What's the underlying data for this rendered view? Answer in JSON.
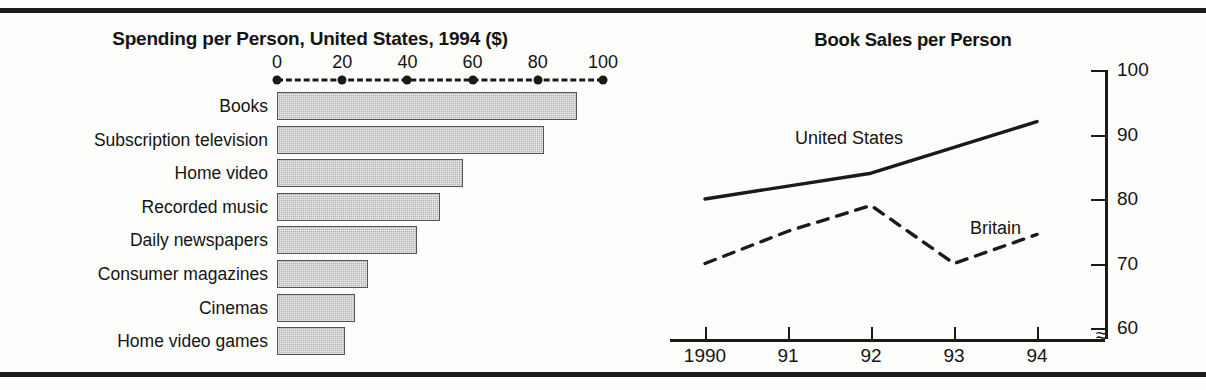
{
  "figure": {
    "panels": [
      {
        "id": "spending-per-person",
        "title": "Spending per Person, United States, 1994 ($)"
      },
      {
        "id": "book-sales-per-person",
        "title": "Book Sales per Person"
      }
    ]
  },
  "chart_data": [
    {
      "type": "bar",
      "orientation": "horizontal",
      "title": "Spending per Person, United States, 1994 ($)",
      "xlabel": "",
      "ylabel": "",
      "xlim": [
        0,
        100
      ],
      "grid": false,
      "legend": "none",
      "axis_position": "top",
      "tick_labels": [
        "0",
        "20",
        "40",
        "60",
        "80",
        "100"
      ],
      "ticks": [
        0,
        20,
        40,
        60,
        80,
        100
      ],
      "categories": [
        "Books",
        "Subscription television",
        "Home video",
        "Recorded music",
        "Daily newspapers",
        "Consumer magazines",
        "Cinemas",
        "Home video games"
      ],
      "values": [
        92,
        82,
        57,
        50,
        43,
        28,
        24,
        21
      ],
      "bar_fill": "#b6b6b6",
      "bar_border": "#555555"
    },
    {
      "type": "line",
      "title": "Book Sales per Person",
      "xlabel": "",
      "ylabel": "",
      "x": [
        1990,
        1991,
        1992,
        1993,
        1994
      ],
      "x_tick_labels": [
        "1990",
        "91",
        "92",
        "93",
        "94"
      ],
      "ylim": [
        60,
        100
      ],
      "y_ticks": [
        60,
        70,
        80,
        90,
        100
      ],
      "y_tick_labels": [
        "60",
        "70",
        "80",
        "90",
        "100"
      ],
      "y_axis_position": "right",
      "axis_break": "≈",
      "grid": false,
      "legend": "inline-labels",
      "series": [
        {
          "name": "United States",
          "style": "solid",
          "color": "#1a1a1a",
          "values": [
            80,
            82,
            84,
            88,
            92
          ],
          "label_text": "United States"
        },
        {
          "name": "Britain",
          "style": "dashed",
          "color": "#1a1a1a",
          "values": [
            70,
            75,
            79,
            70,
            74.5
          ],
          "label_text": "Britain"
        }
      ]
    }
  ]
}
